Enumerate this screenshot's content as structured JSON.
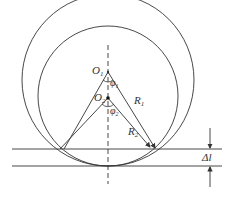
{
  "diagram": {
    "labels": {
      "o1": "O",
      "o1_sub": "1",
      "o2": "O",
      "o2_sub": "2",
      "phi1": "φ",
      "phi1_sub": "1",
      "phi2": "φ",
      "phi2_sub": "2",
      "r1": "R",
      "r1_sub": "1",
      "r2": "R",
      "r2_sub": "2",
      "delta_l": "Δl"
    },
    "colors": {
      "stroke": "#333333",
      "background": "#ffffff"
    }
  }
}
